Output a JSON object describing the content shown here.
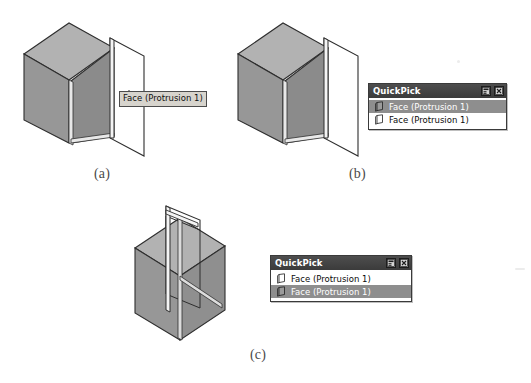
{
  "page": {
    "width": 531,
    "height": 383,
    "background": "#ffffff"
  },
  "figures": [
    {
      "id": "figure-a",
      "caption": "(a)",
      "description": "Isometric solid cube with a highlighted planar face and a protruding reference plane on the right side, annotated by a tooltip.",
      "tooltip": {
        "text": "Face (Protrusion 1)",
        "background": "#d7d4cd",
        "border": "#4c4c4c"
      }
    },
    {
      "id": "figure-b",
      "caption": "(b)",
      "description": "Same isometric solid cube with protruding plane; QuickPick list is shown with the first entry highlighted."
    },
    {
      "id": "figure-c",
      "caption": "(c)",
      "description": "Isometric cube shown with an interior face highlighted through the plane; QuickPick list is shown with the second entry highlighted."
    }
  ],
  "quickpick_b": {
    "title": "QuickPick",
    "buttons": [
      {
        "name": "roll-up-button",
        "glyph": "roll-up-icon"
      },
      {
        "name": "close-button",
        "glyph": "close-icon"
      }
    ],
    "items": [
      {
        "label": "Face (Protrusion 1)",
        "icon": "face-filled-icon",
        "selected": true
      },
      {
        "label": "Face (Protrusion 1)",
        "icon": "face-outline-icon",
        "selected": false
      }
    ],
    "selection_color": "#8e8e8e",
    "titlebar_color": "#434343"
  },
  "quickpick_c": {
    "title": "QuickPick",
    "buttons": [
      {
        "name": "roll-up-button",
        "glyph": "roll-up-icon"
      },
      {
        "name": "close-button",
        "glyph": "close-icon"
      }
    ],
    "items": [
      {
        "label": "Face (Protrusion 1)",
        "icon": "face-outline-icon",
        "selected": false
      },
      {
        "label": "Face (Protrusion 1)",
        "icon": "face-filled-icon",
        "selected": true
      }
    ],
    "selection_color": "#8e8e8e",
    "titlebar_color": "#434343"
  },
  "colors": {
    "cube_top": "#b4b4b4",
    "cube_left": "#9a9a9a",
    "cube_front": "#8d8d8d",
    "cube_highlight_face": "#8a8a8a",
    "outline": "#2e2e2e",
    "plane_fill": "#ffffff",
    "caption_text": "#4a4a4a"
  }
}
